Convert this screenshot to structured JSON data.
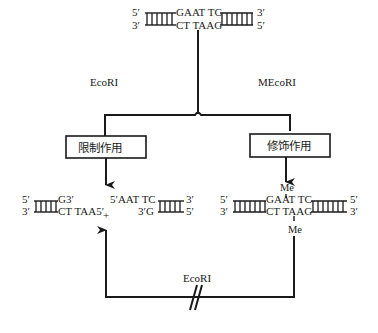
{
  "top_dna": {
    "left_top_end": "5′",
    "left_bottom_end": "3′",
    "top_seq": "GAAT TC",
    "bottom_seq": "CT TAAG",
    "right_top_end": "3′",
    "right_bottom_end": "5′"
  },
  "branch_labels": {
    "left_enzyme": "EcoRI",
    "right_enzyme": "MEcoRI"
  },
  "boxes": {
    "restriction": "限制作用",
    "modification": "修饰作用"
  },
  "cut_products": {
    "left_fragment": {
      "top_end": "5′",
      "bottom_end": "3′",
      "top_seq": "G3′",
      "bottom_seq": "CT TAA5′"
    },
    "plus": "+",
    "right_fragment": {
      "top_seq": "5′AAT TC",
      "bottom_seq": "3′G",
      "top_end": "3′",
      "bottom_end": "5′"
    }
  },
  "methylated_dna": {
    "methyl_top": "Me",
    "methyl_bottom": "Me",
    "left_top_end": "5′",
    "left_bottom_end": "3′",
    "top_seq": "GAAT TC",
    "bottom_seq": "CT TAAG",
    "right_top_end": "5′",
    "right_bottom_end": "3′"
  },
  "feedback": {
    "enzyme_label": "EcoRI",
    "blocked_symbol": "//"
  }
}
